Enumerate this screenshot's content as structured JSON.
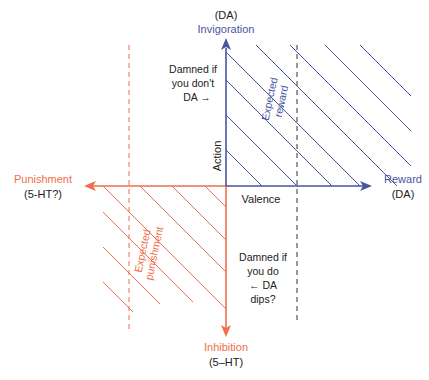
{
  "colors": {
    "reward_blue": "#4a55a0",
    "punishment_orange": "#ef6e4b",
    "text_dark": "#222222",
    "dashed_black": "#333333"
  },
  "axes": {
    "top": {
      "label": "Invigoration",
      "sublabel": "(DA)"
    },
    "bottom": {
      "label": "Inhibition",
      "sublabel": "(5–HT)"
    },
    "right": {
      "label": "Reward",
      "sublabel": "(DA)"
    },
    "left": {
      "label": "Punishment",
      "sublabel": "(5-HT?)"
    },
    "vertical_name": "Action",
    "horizontal_name": "Valence"
  },
  "regions": {
    "expected_reward": {
      "line1": "Expected",
      "line2": "reward"
    },
    "expected_punishment": {
      "line1": "Expected",
      "line2": "punishment"
    }
  },
  "annotations": {
    "damned_dont": {
      "line1": "Damned if",
      "line2": "you don't",
      "line3": "DA →"
    },
    "damned_do": {
      "line1": "Damned if",
      "line2": "you do",
      "line3": "← DA",
      "line4": "dips?"
    }
  }
}
